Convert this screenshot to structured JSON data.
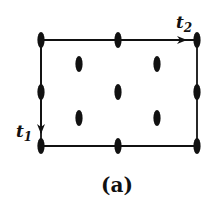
{
  "diagram": {
    "type": "lattice-cell",
    "colors": {
      "ink": "#111111",
      "background": "#ffffff"
    },
    "frame": {
      "left": 41,
      "top": 40,
      "right": 197,
      "bottom": 146
    },
    "vectors": [
      {
        "id": "t1",
        "label": "t",
        "subscript": "1",
        "from": [
          41,
          40
        ],
        "to": [
          41,
          136
        ],
        "direction": "down"
      },
      {
        "id": "t2",
        "label": "t",
        "subscript": "2",
        "from": [
          41,
          40
        ],
        "to": [
          190,
          40
        ],
        "direction": "right"
      }
    ],
    "points": [
      {
        "x": 41,
        "y": 40
      },
      {
        "x": 118,
        "y": 40
      },
      {
        "x": 197,
        "y": 40
      },
      {
        "x": 41,
        "y": 92
      },
      {
        "x": 118,
        "y": 92
      },
      {
        "x": 197,
        "y": 92
      },
      {
        "x": 41,
        "y": 146
      },
      {
        "x": 118,
        "y": 146
      },
      {
        "x": 197,
        "y": 146
      },
      {
        "x": 79,
        "y": 64
      },
      {
        "x": 157,
        "y": 64
      },
      {
        "x": 79,
        "y": 118
      },
      {
        "x": 157,
        "y": 118
      }
    ],
    "caption": "(a)"
  }
}
